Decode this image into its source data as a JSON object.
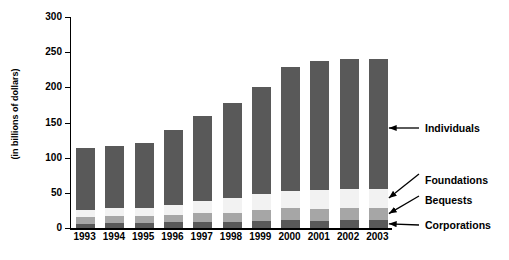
{
  "chart_data": {
    "type": "bar",
    "subtype": "stacked-vertical",
    "title": "",
    "xlabel": "",
    "ylabel": "(in billions of dollars)",
    "ylim": [
      0,
      300
    ],
    "yticks": [
      0,
      50,
      100,
      150,
      200,
      250,
      300
    ],
    "grid": false,
    "legend_position": "right-annotations",
    "categories": [
      "1993",
      "1994",
      "1995",
      "1996",
      "1997",
      "1998",
      "1999",
      "2000",
      "2001",
      "2002",
      "2003"
    ],
    "series": [
      {
        "name": "Corporations",
        "color": "#595959",
        "values": [
          6,
          7,
          7,
          8,
          9,
          9,
          10,
          11,
          10,
          11,
          12
        ]
      },
      {
        "name": "Bequests",
        "color": "#a6a6a6",
        "values": [
          9,
          10,
          10,
          11,
          13,
          13,
          16,
          17,
          17,
          17,
          17
        ]
      },
      {
        "name": "Foundations",
        "color": "#f2f2f2",
        "values": [
          10,
          11,
          11,
          14,
          16,
          20,
          23,
          25,
          27,
          27,
          27
        ]
      },
      {
        "name": "Individuals",
        "color": "#595959",
        "values": [
          89,
          89,
          93,
          106,
          121,
          136,
          152,
          176,
          184,
          186,
          185
        ]
      }
    ],
    "totals": [
      114,
      117,
      121,
      139,
      159,
      178,
      201,
      229,
      238,
      241,
      241
    ],
    "annotations": [
      {
        "label": "Individuals",
        "target_series": "Individuals"
      },
      {
        "label": "Foundations",
        "target_series": "Foundations"
      },
      {
        "label": "Bequests",
        "target_series": "Bequests"
      },
      {
        "label": "Corporations",
        "target_series": "Corporations"
      }
    ]
  },
  "colors": {
    "dark_gray": "#595959",
    "medium_gray": "#a6a6a6",
    "light_gray": "#f2f2f2",
    "axis": "#000000",
    "background": "#ffffff"
  }
}
